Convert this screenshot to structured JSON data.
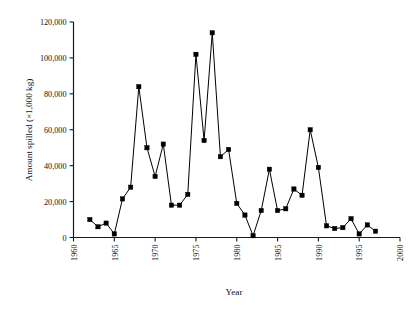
{
  "chart_data": {
    "type": "line",
    "title": "",
    "xlabel": "Year",
    "ylabel": "Amount spilled (×1,000 kg)",
    "xlim": [
      1960,
      2000
    ],
    "ylim": [
      0,
      120000
    ],
    "grid": false,
    "legend": "none",
    "marker": "square",
    "line_color": "#000000",
    "marker_color": "#000000",
    "x_ticks": [
      "1960",
      "1965",
      "1970",
      "1975",
      "1980",
      "1985",
      "1990",
      "1995",
      "2000"
    ],
    "x_tick_values": [
      1960,
      1965,
      1970,
      1975,
      1980,
      1985,
      1990,
      1995,
      2000
    ],
    "y_ticks": [
      "0",
      "20,000",
      "40,000",
      "60,000",
      "80,000",
      "100,000",
      "120,000"
    ],
    "y_tick_values": [
      0,
      20000,
      40000,
      60000,
      80000,
      100000,
      120000
    ],
    "x": [
      1962,
      1963,
      1964,
      1965,
      1966,
      1967,
      1968,
      1969,
      1970,
      1971,
      1972,
      1973,
      1974,
      1975,
      1976,
      1977,
      1978,
      1979,
      1980,
      1981,
      1982,
      1983,
      1984,
      1985,
      1986,
      1987,
      1988,
      1989,
      1990,
      1991,
      1992,
      1993,
      1994,
      1995,
      1996,
      1997
    ],
    "values": [
      10000,
      6000,
      8000,
      2000,
      21500,
      28000,
      84000,
      50000,
      34000,
      52000,
      18000,
      18000,
      24000,
      102000,
      54000,
      114000,
      45000,
      49000,
      19000,
      12500,
      1000,
      15000,
      38000,
      15000,
      16000,
      27000,
      23500,
      60000,
      39000,
      6500,
      5000,
      5500,
      10500,
      2000,
      7000,
      3500
    ],
    "points": [
      {
        "year": 1962,
        "value": 10000
      },
      {
        "year": 1963,
        "value": 6000
      },
      {
        "year": 1964,
        "value": 8000
      },
      {
        "year": 1965,
        "value": 2000
      },
      {
        "year": 1966,
        "value": 21500
      },
      {
        "year": 1967,
        "value": 28000
      },
      {
        "year": 1968,
        "value": 84000
      },
      {
        "year": 1969,
        "value": 50000
      },
      {
        "year": 1970,
        "value": 34000
      },
      {
        "year": 1971,
        "value": 52000
      },
      {
        "year": 1972,
        "value": 18000
      },
      {
        "year": 1973,
        "value": 18000
      },
      {
        "year": 1974,
        "value": 24000
      },
      {
        "year": 1975,
        "value": 102000
      },
      {
        "year": 1976,
        "value": 54000
      },
      {
        "year": 1977,
        "value": 114000
      },
      {
        "year": 1978,
        "value": 45000
      },
      {
        "year": 1979,
        "value": 49000
      },
      {
        "year": 1980,
        "value": 19000
      },
      {
        "year": 1981,
        "value": 12500
      },
      {
        "year": 1982,
        "value": 1000
      },
      {
        "year": 1983,
        "value": 15000
      },
      {
        "year": 1984,
        "value": 38000
      },
      {
        "year": 1985,
        "value": 15000
      },
      {
        "year": 1986,
        "value": 16000
      },
      {
        "year": 1987,
        "value": 27000
      },
      {
        "year": 1988,
        "value": 23500
      },
      {
        "year": 1989,
        "value": 60000
      },
      {
        "year": 1990,
        "value": 39000
      },
      {
        "year": 1991,
        "value": 6500
      },
      {
        "year": 1992,
        "value": 5000
      },
      {
        "year": 1993,
        "value": 5500
      },
      {
        "year": 1994,
        "value": 10500
      },
      {
        "year": 1995,
        "value": 2000
      },
      {
        "year": 1996,
        "value": 7000
      },
      {
        "year": 1997,
        "value": 3500
      }
    ]
  }
}
